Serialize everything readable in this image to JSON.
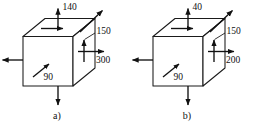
{
  "figure": {
    "background_color": "#ffffff",
    "line_color": "#1a1a1a",
    "arrow_color": "#111111"
  },
  "elements": [
    {
      "id": "a",
      "caption": "a)",
      "labels": {
        "top": "140",
        "shear_right": "150",
        "normal_right": "300",
        "front_diagonal": "90"
      },
      "arrows": {
        "top_outward": "up",
        "top_face_inplane": "right",
        "left_outward": "left",
        "bottom_outward": "down",
        "right_face_shear": "up",
        "right_face_normal": "right",
        "depth_diagonal": "up-right",
        "front_face_diagonal": "up-right"
      }
    },
    {
      "id": "b",
      "caption": "b)",
      "labels": {
        "top": "40",
        "shear_right": "150",
        "normal_right": "200",
        "front_diagonal": "90"
      },
      "arrows": {
        "top_outward": "up",
        "top_face_inplane": "right",
        "left_outward": "left",
        "bottom_outward": "down",
        "right_face_shear": "up",
        "right_face_normal": "right",
        "depth_diagonal": "up-right",
        "front_face_diagonal": "up-right"
      }
    }
  ]
}
